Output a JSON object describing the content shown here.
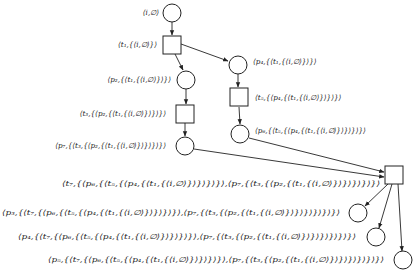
{
  "diagram": {
    "type": "petri-net-unfolding",
    "nodes": [
      {
        "id": "pi",
        "kind": "place",
        "cx": 172,
        "cy": 13,
        "label": "⟨i,∅⟩",
        "lx": 159,
        "ly": 15,
        "anchor": "end"
      },
      {
        "id": "t1",
        "kind": "transition",
        "x": 163,
        "y": 36,
        "w": 18,
        "h": 18,
        "label": "⟨t₁,{⟨i,∅⟩}⟩",
        "lx": 157,
        "ly": 47,
        "anchor": "end"
      },
      {
        "id": "p2",
        "kind": "place",
        "cx": 186,
        "cy": 80,
        "label": "⟨p₂,{⟨t₁,{⟨i,∅⟩}⟩}⟩",
        "lx": 171,
        "ly": 82,
        "anchor": "end"
      },
      {
        "id": "t3",
        "kind": "transition",
        "x": 176,
        "y": 105,
        "w": 18,
        "h": 18,
        "label": "⟨t₃,{⟨p₂,{⟨t₁,{⟨i,∅⟩}⟩}⟩}⟩",
        "lx": 166,
        "ly": 116,
        "anchor": "end"
      },
      {
        "id": "p7",
        "kind": "place",
        "cx": 185,
        "cy": 146,
        "label": "⟨p₇,{⟨t₃,{⟨p₂,{⟨t₁,{⟨i,∅⟩}⟩}⟩}⟩}⟩",
        "lx": 166,
        "ly": 148,
        "anchor": "end"
      },
      {
        "id": "p4",
        "kind": "place",
        "cx": 238,
        "cy": 65,
        "label": "⟨p₄,{⟨t₁,{⟨i,∅⟩}⟩}⟩",
        "lx": 253,
        "ly": 64,
        "anchor": "start"
      },
      {
        "id": "t5",
        "kind": "transition",
        "x": 230,
        "y": 88,
        "w": 18,
        "h": 18,
        "label": "⟨t₅,{⟨p₄,{⟨t₁,{⟨i,∅⟩}⟩}⟩}⟩",
        "lx": 255,
        "ly": 100,
        "anchor": "start"
      },
      {
        "id": "p6",
        "kind": "place",
        "cx": 240,
        "cy": 134,
        "label": "⟨p₆,{⟨t₅,{⟨p₄,{⟨t₁,{⟨i,∅⟩}⟩}⟩}⟩}⟩",
        "lx": 255,
        "ly": 133,
        "anchor": "start"
      },
      {
        "id": "t7",
        "kind": "transition",
        "x": 385,
        "y": 166,
        "w": 18,
        "h": 18,
        "label": "⟨t₇,{⟨p₆,{⟨t₅,{⟨p₄,{⟨t₁,{⟨i,∅⟩}⟩}⟩}⟩}⟩,⟨p₇,{⟨t₃,{⟨p₂,{⟨t₁,{⟨i,∅⟩}⟩}⟩}⟩}⟩}⟩",
        "lx": 62,
        "ly": 186,
        "anchor": "start"
      },
      {
        "id": "p3",
        "kind": "place",
        "cx": 358,
        "cy": 213,
        "label": "⟨p₃,{⟨t₇,{⟨p₆,{⟨t₅,{⟨p₄,{⟨t₁,{⟨i,∅⟩}⟩}⟩}⟩}⟩,⟨p₇,{⟨t₃,{⟨p₂,{⟨t₁,{⟨i,∅⟩}⟩}⟩}⟩}⟩}⟩}⟩",
        "lx": 2,
        "ly": 215,
        "anchor": "start"
      },
      {
        "id": "p4b",
        "kind": "place",
        "cx": 376,
        "cy": 237,
        "label": "⟨p₄,{⟨t₇,{⟨p₆,{⟨t₅,{⟨p₄,{⟨t₁,{⟨i,∅⟩}⟩}⟩}⟩}⟩,⟨p₇,{⟨t₃,{⟨p₂,{⟨t₁,{⟨i,∅⟩}⟩}⟩}⟩}⟩}⟩}⟩",
        "lx": 18,
        "ly": 239,
        "anchor": "start"
      },
      {
        "id": "p5",
        "kind": "place",
        "cx": 403,
        "cy": 260,
        "label": "⟨p₅,{⟨t₇,{⟨p₆,{⟨t₅,{⟨p₄,{⟨t₁,{⟨i,∅⟩}⟩}⟩}⟩}⟩,⟨p₇,{⟨t₃,{⟨p₂,{⟨t₁,{⟨i,∅⟩}⟩}⟩}⟩}⟩}⟩}⟩",
        "lx": 48,
        "ly": 262,
        "anchor": "start"
      }
    ],
    "edges": [
      {
        "from": "pi",
        "to": "t1"
      },
      {
        "from": "t1",
        "to": "p2"
      },
      {
        "from": "t1",
        "to": "p4"
      },
      {
        "from": "p2",
        "to": "t3"
      },
      {
        "from": "t3",
        "to": "p7"
      },
      {
        "from": "p4",
        "to": "t5"
      },
      {
        "from": "t5",
        "to": "p6"
      },
      {
        "from": "p6",
        "to": "t7"
      },
      {
        "from": "p7",
        "to": "t7"
      },
      {
        "from": "t7",
        "to": "p3"
      },
      {
        "from": "t7",
        "to": "p4b"
      },
      {
        "from": "t7",
        "to": "p5"
      }
    ],
    "colors": {
      "stroke": "#222222",
      "fill": "#ffffff",
      "background": "#ffffff"
    }
  }
}
